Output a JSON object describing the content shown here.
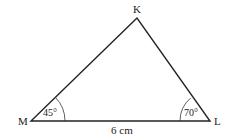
{
  "diagram": {
    "type": "triangle",
    "vertices": {
      "K": {
        "label": "K"
      },
      "M": {
        "label": "M"
      },
      "L": {
        "label": "L"
      }
    },
    "angles": {
      "M": "45°",
      "L": "70°"
    },
    "sides": {
      "ML": "6 cm"
    },
    "stroke_color": "#222222"
  }
}
